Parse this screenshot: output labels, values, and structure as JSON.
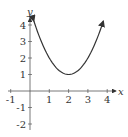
{
  "chart_data": {
    "type": "line",
    "title": "",
    "xlabel": "x",
    "ylabel": "y",
    "xlim": [
      -1,
      4
    ],
    "ylim": [
      -2,
      4
    ],
    "grid": false,
    "x_ticks": [
      "-1",
      "1",
      "2",
      "3",
      "4"
    ],
    "y_ticks": [
      "4",
      "3",
      "2",
      "1",
      "-1",
      "-2"
    ],
    "series": [
      {
        "name": "f(x)",
        "function": "(x-2)^2 + 1",
        "x": [
          0.2,
          0.5,
          1,
          1.5,
          2,
          2.5,
          3,
          3.5,
          3.8
        ],
        "y": [
          4.24,
          3.25,
          2,
          1.25,
          1,
          1.25,
          2,
          3.25,
          4.24
        ],
        "arrows_at_ends": true
      }
    ],
    "color": "#333333"
  }
}
